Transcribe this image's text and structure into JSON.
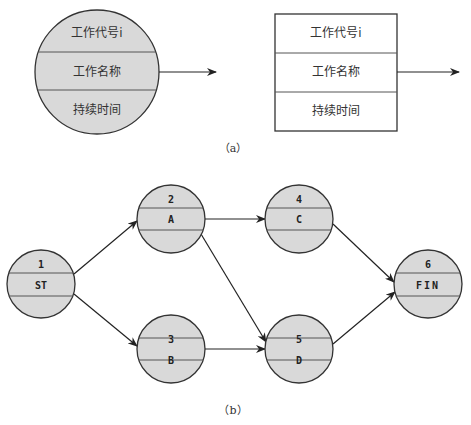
{
  "part_a": {
    "caption": "（a）",
    "circle_node": {
      "fields": [
        "工作代号i",
        "工作名称",
        "持续时间"
      ]
    },
    "box_node": {
      "fields": [
        "工作代号i",
        "工作名称",
        "持续时间"
      ]
    }
  },
  "part_b": {
    "caption": "（b）",
    "nodes": [
      {
        "id": "1",
        "name": "ST"
      },
      {
        "id": "2",
        "name": "A"
      },
      {
        "id": "3",
        "name": "B"
      },
      {
        "id": "4",
        "name": "C"
      },
      {
        "id": "5",
        "name": "D"
      },
      {
        "id": "6",
        "name": "FIN"
      }
    ],
    "edges": [
      [
        "1",
        "2"
      ],
      [
        "1",
        "3"
      ],
      [
        "2",
        "4"
      ],
      [
        "2",
        "5"
      ],
      [
        "3",
        "5"
      ],
      [
        "4",
        "6"
      ],
      [
        "5",
        "6"
      ]
    ]
  },
  "colors": {
    "node_fill": "#d9d9d9",
    "stroke": "#333333",
    "background": "#ffffff"
  }
}
